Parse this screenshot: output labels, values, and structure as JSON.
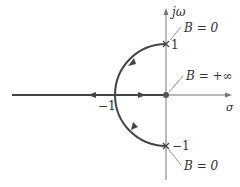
{
  "diagram": {
    "type": "root-locus",
    "axes": {
      "imag_label": "jω",
      "real_label": "σ"
    },
    "labels": {
      "upper_pole_value": "1",
      "lower_pole_value": "−1",
      "breakaway_value": "−1",
      "upper_pole_note": "B = 0",
      "lower_pole_note": "B = 0",
      "origin_note": "B = +∞"
    },
    "colors": {
      "locus": "#444444",
      "axis": "#777777",
      "text": "#333333"
    }
  }
}
